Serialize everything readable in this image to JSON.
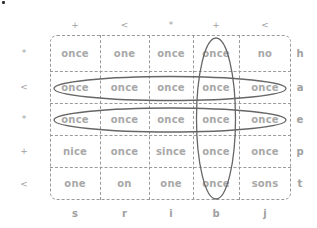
{
  "colors": {
    "text": "#a8a8a8",
    "grid_line": "#9a9a9a",
    "ellipse": "#666666",
    "label": "#a0a0a0"
  },
  "top_labels": [
    "+",
    "<",
    "*",
    "+",
    "<"
  ],
  "left_labels": [
    "*",
    "<",
    "*",
    "+",
    "<"
  ],
  "right_labels": [
    "h",
    "a",
    "e",
    "p",
    "t"
  ],
  "bottom_labels": [
    "s",
    "r",
    "i",
    "b",
    "j"
  ],
  "grid": {
    "rows": [
      [
        "once",
        "one",
        "once",
        "once",
        "no"
      ],
      [
        "once",
        "once",
        "once",
        "once",
        "once"
      ],
      [
        "once",
        "once",
        "once",
        "once",
        "once"
      ],
      [
        "nice",
        "once",
        "since",
        "once",
        "once"
      ],
      [
        "one",
        "on",
        "one",
        "once",
        "sons"
      ]
    ]
  },
  "highlights": [
    {
      "type": "row",
      "index": 1,
      "label": "a"
    },
    {
      "type": "row",
      "index": 2,
      "label": "e"
    },
    {
      "type": "column",
      "index": 3,
      "label": "b"
    }
  ]
}
